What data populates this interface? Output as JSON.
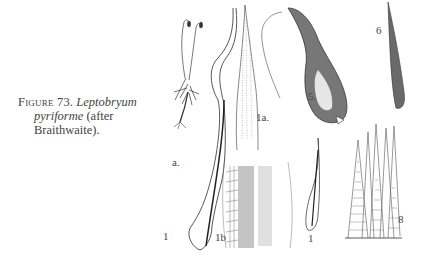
{
  "caption": {
    "figure_label": "Figure 73.",
    "genus": "Leptobryum",
    "species": "pyriforme",
    "attribution_open": "(after",
    "attribution_name": "Braithwaite)."
  },
  "plate_labels": {
    "a": "a.",
    "leaf_1": "1",
    "leaf_1a": "1a.",
    "leaf_1b": "1b",
    "capsule_5": "5.",
    "item_6": "6",
    "leaf_1_small": "1",
    "teeth_8": "8"
  }
}
